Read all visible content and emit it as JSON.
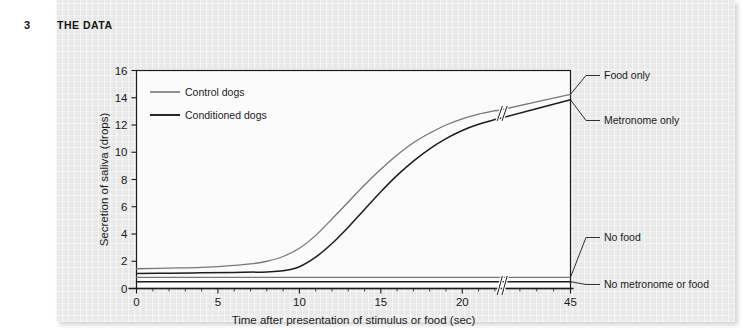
{
  "header": {
    "number": "3",
    "title": "THE DATA"
  },
  "chart_data": {
    "type": "line",
    "title": "",
    "xlabel": "Time after presentation of stimulus or food (sec)",
    "ylabel": "Secretion of saliva (drops)",
    "xlim": [
      0,
      45
    ],
    "ylim": [
      0,
      16
    ],
    "x_ticks": [
      "0",
      "5",
      "10",
      "15",
      "20",
      "45"
    ],
    "x_tick_values": [
      0,
      5,
      10,
      15,
      20,
      45
    ],
    "y_ticks": [
      "0",
      "2",
      "4",
      "6",
      "8",
      "10",
      "12",
      "14",
      "16"
    ],
    "y_tick_values": [
      0,
      2,
      4,
      6,
      8,
      10,
      12,
      14,
      16
    ],
    "grid": true,
    "axis_break": {
      "axis": "x",
      "at": 22.5,
      "label": "broken-axis-marker"
    },
    "legend": {
      "position": "top-left-inside",
      "entries": [
        {
          "label": "Control dogs",
          "color": "#77777a",
          "width": 1.6
        },
        {
          "label": "Conditioned dogs",
          "color": "#1d1d1f",
          "width": 1.9
        }
      ]
    },
    "series": [
      {
        "name": "Food only",
        "group": "Control dogs",
        "color": "#77777a",
        "end_label": "Food only",
        "x": [
          0,
          2,
          4,
          6,
          7,
          8,
          9,
          10,
          11,
          12,
          13,
          14,
          15,
          16,
          17,
          18,
          19,
          20,
          21,
          22,
          22.5,
          45
        ],
        "y": [
          1.45,
          1.5,
          1.55,
          1.7,
          1.8,
          2.0,
          2.35,
          2.95,
          3.9,
          5.1,
          6.35,
          7.6,
          8.75,
          9.8,
          10.7,
          11.4,
          12.0,
          12.45,
          12.8,
          13.05,
          13.15,
          14.25
        ]
      },
      {
        "name": "Metronome only",
        "group": "Conditioned dogs",
        "color": "#1d1d1f",
        "end_label": "Metronome only",
        "x": [
          0,
          2,
          4,
          6,
          8,
          9,
          10,
          11,
          12,
          13,
          14,
          15,
          16,
          17,
          18,
          19,
          20,
          21,
          22,
          22.5,
          45
        ],
        "y": [
          1.1,
          1.12,
          1.15,
          1.18,
          1.22,
          1.3,
          1.6,
          2.3,
          3.3,
          4.5,
          5.8,
          7.1,
          8.3,
          9.35,
          10.25,
          11.0,
          11.6,
          12.05,
          12.4,
          12.55,
          13.85
        ]
      },
      {
        "name": "No food",
        "group": "Control dogs",
        "color": "#77777a",
        "end_label": "No food",
        "x": [
          0,
          45
        ],
        "y": [
          0.82,
          0.82
        ]
      },
      {
        "name": "No metronome or food",
        "group": "Conditioned dogs",
        "color": "#1d1d1f",
        "end_label": "No metronome or food",
        "x": [
          0,
          45
        ],
        "y": [
          0.5,
          0.5
        ]
      }
    ],
    "annotations": [
      {
        "text": "Food only",
        "anchor_series": "Food only",
        "side": "right",
        "order": 0
      },
      {
        "text": "Metronome only",
        "anchor_series": "Metronome only",
        "side": "right",
        "order": 1
      },
      {
        "text": "No food",
        "anchor_series": "No food",
        "side": "right",
        "order": 2
      },
      {
        "text": "No metronome or food",
        "anchor_series": "No metronome or food",
        "side": "right",
        "order": 3
      }
    ]
  },
  "colors": {
    "panel_bg": "#e9e9e9",
    "plot_bg": "#fbfbfb",
    "grid_minor": "#dedede",
    "grid_major": "#c9c9c9",
    "axis": "#1b1b1b",
    "control": "#77777a",
    "conditioned": "#1d1d1f",
    "text": "#1b1b1b"
  }
}
